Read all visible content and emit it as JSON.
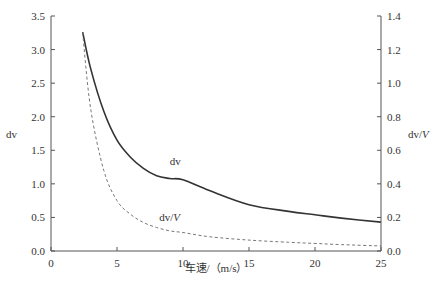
{
  "chart_data": {
    "type": "line",
    "title": "",
    "xlabel": "车速/（m/s）",
    "ylabel_left": "dv",
    "ylabel_right": "dv/V",
    "xlim": [
      0,
      25
    ],
    "ylim_left": [
      0,
      3.5
    ],
    "ylim_right": [
      0,
      1.4
    ],
    "x_ticks": [
      0,
      5,
      10,
      15,
      20,
      25
    ],
    "y_ticks_left": [
      "0.0",
      "0.5",
      "1.0",
      "1.5",
      "2.0",
      "2.5",
      "3.0",
      "3.5"
    ],
    "y_ticks_right": [
      "0.0",
      "0.2",
      "0.4",
      "0.6",
      "0.8",
      "1.0",
      "1.2",
      "1.4"
    ],
    "grid": false,
    "legend": "inline annotations",
    "series": [
      {
        "name": "dv",
        "axis": "left",
        "style": "solid",
        "color": "#333333",
        "label_pos": [
          9,
          1.28
        ],
        "x": [
          2.4,
          3,
          4,
          5,
          6,
          7,
          8,
          9,
          10,
          12,
          15,
          18,
          20,
          22,
          25
        ],
        "values": [
          3.26,
          2.72,
          2.08,
          1.65,
          1.4,
          1.23,
          1.12,
          1.08,
          1.06,
          0.9,
          0.69,
          0.59,
          0.54,
          0.49,
          0.43
        ]
      },
      {
        "name": "dv/V",
        "axis": "right",
        "style": "dashed",
        "color": "#777777",
        "label_pos": [
          8.2,
          0.18
        ],
        "x": [
          2.4,
          3,
          4,
          5,
          6,
          7,
          8,
          9,
          10,
          12,
          15,
          18,
          20,
          22,
          25
        ],
        "values": [
          1.3,
          0.85,
          0.48,
          0.3,
          0.22,
          0.17,
          0.14,
          0.12,
          0.11,
          0.085,
          0.065,
          0.052,
          0.045,
          0.038,
          0.03
        ]
      }
    ]
  }
}
